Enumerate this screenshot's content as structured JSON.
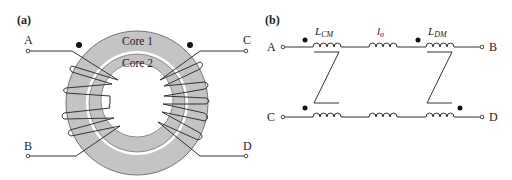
{
  "panel_a": {
    "label": "(a)",
    "terminals": {
      "A": "A",
      "B": "B",
      "C": "C",
      "D": "D"
    },
    "core_outer_label": "Core 1",
    "core_inner_label": "Core 2",
    "colors": {
      "core_fill": "#c4c4c4",
      "gap": "#ffffff",
      "wire": "#333333",
      "dot": "#111111"
    }
  },
  "panel_b": {
    "label": "(b)",
    "terminals": {
      "A": "A",
      "B": "B",
      "C": "C",
      "D": "D"
    },
    "inductors": {
      "common_mode": {
        "main": "L",
        "sub": "CM"
      },
      "leakage": {
        "main": "l",
        "sub": "σ"
      },
      "differential_mode": {
        "main": "L",
        "sub": "DM"
      }
    }
  }
}
